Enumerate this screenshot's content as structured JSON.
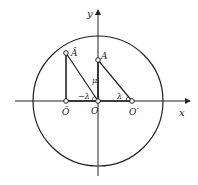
{
  "diagram": {
    "axes": {
      "x_label": "x",
      "y_label": "y"
    },
    "circle": {
      "cx": 98,
      "cy": 101,
      "r": 65
    },
    "points": {
      "O_bar": {
        "label": "Ō",
        "x": 66,
        "y": 101
      },
      "A_bar": {
        "label": "Ā",
        "x": 66,
        "y": 53
      },
      "O": {
        "label": "O",
        "x": 98,
        "y": 101
      },
      "A": {
        "label": "A",
        "x": 98,
        "y": 60
      },
      "O_prime": {
        "label": "O′",
        "x": 132,
        "y": 101
      }
    },
    "annotations": {
      "mu": "μ",
      "neg_lambda": "−λ",
      "lambda": "λ"
    },
    "colors": {
      "stroke": "#222222",
      "background": "#ffffff"
    }
  }
}
